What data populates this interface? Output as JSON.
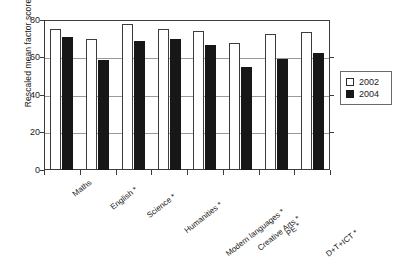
{
  "chart_data": {
    "type": "bar",
    "title": "",
    "xlabel": "",
    "ylabel": "Rescaled mean factor score",
    "ylim": [
      0,
      80
    ],
    "yticks": [
      0,
      20,
      40,
      60,
      80
    ],
    "grid": true,
    "legend_position": "right",
    "categories": [
      "Maths",
      "English *",
      "Science *",
      "Humanities *",
      "Modern languages *",
      "Creative Arts *",
      "PE *",
      "D+T+ICT *"
    ],
    "series": [
      {
        "name": "2002",
        "color": "#ffffff",
        "values": [
          75,
          70,
          78,
          75,
          74,
          68,
          72.5,
          73.5
        ]
      },
      {
        "name": "2004",
        "color": "#171717",
        "values": [
          71,
          58.5,
          69,
          70,
          66.5,
          55,
          59,
          62.5
        ]
      }
    ]
  },
  "axis": {
    "y_title": "Rescaled mean factor score",
    "y_tick_labels": [
      "80",
      "60",
      "40",
      "20",
      "0"
    ]
  },
  "legend": {
    "items": [
      {
        "label": "2002",
        "swatch": "hollow-square"
      },
      {
        "label": "2004",
        "swatch": "filled-square"
      }
    ]
  }
}
